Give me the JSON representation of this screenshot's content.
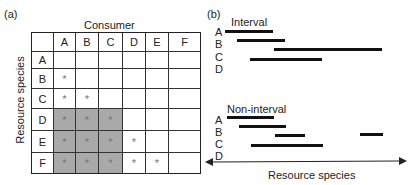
{
  "panel_a": {
    "label": "(a)",
    "x_title": "Consumer",
    "y_title": "Resource species",
    "columns": [
      "A",
      "B",
      "C",
      "D",
      "E",
      "F"
    ],
    "rows": [
      "A",
      "B",
      "C",
      "D",
      "E",
      "F"
    ],
    "matrix": [
      [
        "",
        "",
        "",
        "",
        "",
        ""
      ],
      [
        "*",
        "",
        "",
        "",
        "",
        ""
      ],
      [
        "*",
        "*",
        "",
        "",
        "",
        ""
      ],
      [
        "*",
        "*",
        "*",
        "",
        "",
        ""
      ],
      [
        "*",
        "*",
        "*",
        "*",
        "",
        ""
      ],
      [
        "*",
        "*",
        "*",
        "*",
        "*",
        ""
      ]
    ],
    "shaded_block": {
      "rows": [
        "D",
        "E",
        "F"
      ],
      "columns": [
        "A",
        "B",
        "C"
      ]
    }
  },
  "panel_b": {
    "label": "(b)",
    "interval": {
      "title": "Interval",
      "rows": [
        "A",
        "B",
        "C",
        "D"
      ]
    },
    "non_interval": {
      "title": "Non-interval",
      "rows": [
        "A",
        "B",
        "C",
        "D"
      ]
    },
    "axis_label": "Resource species"
  }
}
